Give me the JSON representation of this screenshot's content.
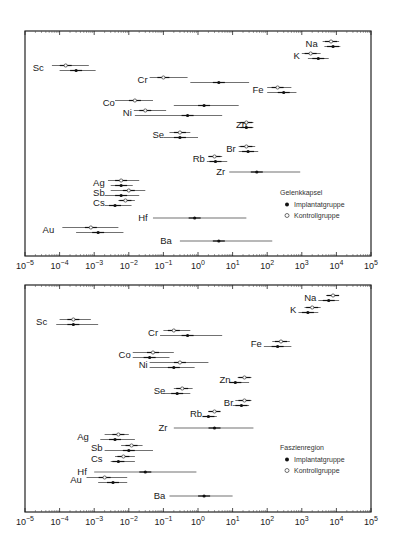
{
  "chart_data": [
    {
      "type": "scatter",
      "subtype": "log-range-plot",
      "title": "Gelenkkapsel",
      "xscale": "log",
      "xlim": [
        1e-05,
        100000.0
      ],
      "x_tick_labels": [
        "10-5",
        "10-4",
        "10-3",
        "10-2",
        "10-1",
        "100",
        "101",
        "102",
        "103",
        "104",
        "105"
      ],
      "legend": {
        "title": "Gelenkkapsel",
        "entries": [
          {
            "marker": "filled",
            "label": "Implantatgruppe"
          },
          {
            "marker": "open",
            "label": "Kontrollgruppe"
          }
        ]
      },
      "elements": [
        {
          "name": "Na",
          "label_x": 3300,
          "y": 44,
          "kontroll": {
            "v": 7000,
            "lo": 4000,
            "hi": 12000
          },
          "implantat": {
            "v": 8000,
            "lo": 4500,
            "hi": 13000
          }
        },
        {
          "name": "K",
          "label_x": 1000,
          "y": 56,
          "kontroll": {
            "v": 1800,
            "lo": 1000,
            "hi": 3500
          },
          "implantat": {
            "v": 3000,
            "lo": 1500,
            "hi": 6000
          }
        },
        {
          "name": "Sc",
          "label_x": 4e-05,
          "y": 68,
          "kontroll": {
            "v": 0.00015,
            "lo": 6e-05,
            "hi": 0.0007
          },
          "implantat": {
            "v": 0.0003,
            "lo": 0.0001,
            "hi": 0.0011
          }
        },
        {
          "name": "Cr",
          "label_x": 0.04,
          "y": 80,
          "kontroll": {
            "v": 0.1,
            "lo": 0.04,
            "hi": 0.5
          },
          "implantat": {
            "v": 4,
            "lo": 0.6,
            "hi": 30
          }
        },
        {
          "name": "Fe",
          "label_x": 90,
          "y": 90,
          "kontroll": {
            "v": 200,
            "lo": 100,
            "hi": 500
          },
          "implantat": {
            "v": 300,
            "lo": 100,
            "hi": 700
          }
        },
        {
          "name": "Co",
          "label_x": 0.0045,
          "y": 103,
          "kontroll": {
            "v": 0.015,
            "lo": 0.004,
            "hi": 0.05
          },
          "implantat": {
            "v": 1.5,
            "lo": 0.2,
            "hi": 15
          }
        },
        {
          "name": "Ni",
          "label_x": 0.014,
          "y": 113,
          "kontroll": {
            "v": 0.03,
            "lo": 0.014,
            "hi": 0.12
          },
          "implantat": {
            "v": 0.5,
            "lo": 0.015,
            "hi": 5
          }
        },
        {
          "name": "Zn",
          "label_x": 30,
          "y": 125,
          "kontroll": {
            "v": 25,
            "lo": 15,
            "hi": 40
          },
          "implantat": {
            "v": 25,
            "lo": 15,
            "hi": 40
          }
        },
        {
          "name": "Se",
          "label_x": 0.12,
          "y": 135,
          "kontroll": {
            "v": 0.3,
            "lo": 0.15,
            "hi": 0.6
          },
          "implantat": {
            "v": 0.3,
            "lo": 0.1,
            "hi": 1.0
          }
        },
        {
          "name": "Br",
          "label_x": 14,
          "y": 149,
          "kontroll": {
            "v": 25,
            "lo": 15,
            "hi": 45
          },
          "implantat": {
            "v": 28,
            "lo": 15,
            "hi": 55
          }
        },
        {
          "name": "Rb",
          "label_x": 1.8,
          "y": 159,
          "kontroll": {
            "v": 3,
            "lo": 2,
            "hi": 5
          },
          "implantat": {
            "v": 3.2,
            "lo": 1.8,
            "hi": 7
          }
        },
        {
          "name": "Zr",
          "label_x": 7,
          "y": 172,
          "kontroll": null,
          "implantat": {
            "v": 50,
            "lo": 8,
            "hi": 900
          }
        },
        {
          "name": "Ag",
          "label_x": 0.0023,
          "y": 183,
          "kontroll": {
            "v": 0.006,
            "lo": 0.0025,
            "hi": 0.02
          },
          "implantat": {
            "v": 0.006,
            "lo": 0.003,
            "hi": 0.013
          }
        },
        {
          "name": "Sb",
          "label_x": 0.0023,
          "y": 193,
          "kontroll": {
            "v": 0.01,
            "lo": 0.003,
            "hi": 0.03
          },
          "implantat": {
            "v": 0.006,
            "lo": 0.002,
            "hi": 0.02
          }
        },
        {
          "name": "Cs",
          "label_x": 0.0023,
          "y": 203,
          "kontroll": {
            "v": 0.008,
            "lo": 0.005,
            "hi": 0.015
          },
          "implantat": {
            "v": 0.004,
            "lo": 0.002,
            "hi": 0.012
          }
        },
        {
          "name": "Hf",
          "label_x": 0.04,
          "y": 218,
          "kontroll": null,
          "implantat": {
            "v": 0.8,
            "lo": 0.05,
            "hi": 25
          }
        },
        {
          "name": "Au",
          "label_x": 8e-05,
          "y": 230,
          "kontroll": {
            "v": 0.0008,
            "lo": 0.00012,
            "hi": 0.005
          },
          "implantat": {
            "v": 0.0013,
            "lo": 0.0003,
            "hi": 0.007
          }
        },
        {
          "name": "Ba",
          "label_x": 0.2,
          "y": 241,
          "kontroll": null,
          "implantat": {
            "v": 4,
            "lo": 0.3,
            "hi": 140
          }
        }
      ]
    },
    {
      "type": "scatter",
      "subtype": "log-range-plot",
      "title": "Faszienregion",
      "xscale": "log",
      "xlim": [
        1e-05,
        100000.0
      ],
      "x_tick_labels": [
        "10-5",
        "10-4",
        "10-3",
        "10-2",
        "10-1",
        "100",
        "101",
        "102",
        "103",
        "104",
        "105"
      ],
      "legend": {
        "title": "Faszienregion",
        "entries": [
          {
            "marker": "filled",
            "label": "Implantatgruppe"
          },
          {
            "marker": "open",
            "label": "Kontrollgruppe"
          }
        ]
      },
      "elements": [
        {
          "name": "Na",
          "label_x": 3000,
          "y": 298,
          "kontroll": {
            "v": 8000,
            "lo": 5000,
            "hi": 12000
          },
          "implantat": {
            "v": 6000,
            "lo": 3000,
            "hi": 12000
          }
        },
        {
          "name": "K",
          "label_x": 800,
          "y": 310,
          "kontroll": {
            "v": 2000,
            "lo": 1200,
            "hi": 3500
          },
          "implantat": {
            "v": 1500,
            "lo": 800,
            "hi": 3000
          }
        },
        {
          "name": "Sc",
          "label_x": 5e-05,
          "y": 322,
          "kontroll": {
            "v": 0.00025,
            "lo": 0.0001,
            "hi": 0.0008
          },
          "implantat": {
            "v": 0.00025,
            "lo": 8e-05,
            "hi": 0.0013
          }
        },
        {
          "name": "Cr",
          "label_x": 0.08,
          "y": 333,
          "kontroll": {
            "v": 0.2,
            "lo": 0.1,
            "hi": 0.6
          },
          "implantat": {
            "v": 0.5,
            "lo": 0.08,
            "hi": 5
          }
        },
        {
          "name": "Fe",
          "label_x": 80,
          "y": 344,
          "kontroll": {
            "v": 250,
            "lo": 140,
            "hi": 450
          },
          "implantat": {
            "v": 200,
            "lo": 80,
            "hi": 500
          }
        },
        {
          "name": "Co",
          "label_x": 0.013,
          "y": 355,
          "kontroll": {
            "v": 0.05,
            "lo": 0.013,
            "hi": 0.2
          },
          "implantat": {
            "v": 0.04,
            "lo": 0.013,
            "hi": 0.15
          }
        },
        {
          "name": "Ni",
          "label_x": 0.04,
          "y": 365,
          "kontroll": {
            "v": 0.3,
            "lo": 0.04,
            "hi": 2
          },
          "implantat": {
            "v": 0.2,
            "lo": 0.04,
            "hi": 0.8
          }
        },
        {
          "name": "Zn",
          "label_x": 10,
          "y": 380,
          "kontroll": {
            "v": 22,
            "lo": 14,
            "hi": 35
          },
          "implantat": {
            "v": 12,
            "lo": 8,
            "hi": 30
          }
        },
        {
          "name": "Se",
          "label_x": 0.13,
          "y": 391,
          "kontroll": {
            "v": 0.35,
            "lo": 0.2,
            "hi": 0.7
          },
          "implantat": {
            "v": 0.25,
            "lo": 0.1,
            "hi": 0.6
          }
        },
        {
          "name": "Br",
          "label_x": 12,
          "y": 403,
          "kontroll": {
            "v": 22,
            "lo": 12,
            "hi": 35
          },
          "implantat": {
            "v": 18,
            "lo": 10,
            "hi": 30
          }
        },
        {
          "name": "Rb",
          "label_x": 1.5,
          "y": 414,
          "kontroll": {
            "v": 3,
            "lo": 2,
            "hi": 4
          },
          "implantat": {
            "v": 2,
            "lo": 1.5,
            "hi": 3.5
          }
        },
        {
          "name": "Zr",
          "label_x": 0.15,
          "y": 428,
          "kontroll": null,
          "implantat": {
            "v": 3,
            "lo": 0.2,
            "hi": 40
          }
        },
        {
          "name": "Ag",
          "label_x": 0.0008,
          "y": 437,
          "kontroll": {
            "v": 0.005,
            "lo": 0.002,
            "hi": 0.01
          },
          "implantat": {
            "v": 0.004,
            "lo": 0.0015,
            "hi": 0.015
          }
        },
        {
          "name": "Sb",
          "label_x": 0.002,
          "y": 448,
          "kontroll": {
            "v": 0.012,
            "lo": 0.006,
            "hi": 0.025
          },
          "implantat": {
            "v": 0.01,
            "lo": 0.002,
            "hi": 0.05
          }
        },
        {
          "name": "Cs",
          "label_x": 0.002,
          "y": 459,
          "kontroll": {
            "v": 0.007,
            "lo": 0.004,
            "hi": 0.015
          },
          "implantat": {
            "v": 0.005,
            "lo": 0.003,
            "hi": 0.015
          }
        },
        {
          "name": "Hf",
          "label_x": 0.0007,
          "y": 472,
          "kontroll": null,
          "implantat": {
            "v": 0.03,
            "lo": 0.001,
            "hi": 0.9
          }
        },
        {
          "name": "Au",
          "label_x": 0.0005,
          "y": 480,
          "kontroll": {
            "v": 0.002,
            "lo": 0.0006,
            "hi": 0.009
          },
          "implantat": {
            "v": 0.0035,
            "lo": 0.0013,
            "hi": 0.009
          }
        },
        {
          "name": "Ba",
          "label_x": 0.13,
          "y": 496,
          "kontroll": null,
          "implantat": {
            "v": 1.5,
            "lo": 0.15,
            "hi": 10
          }
        }
      ]
    }
  ]
}
